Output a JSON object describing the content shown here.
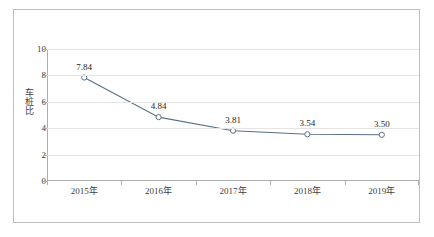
{
  "chart_data": {
    "type": "line",
    "title": "",
    "xlabel": "",
    "ylabel": "车桩比",
    "categories": [
      "2015年",
      "2016年",
      "2017年",
      "2018年",
      "2019年"
    ],
    "values": [
      7.84,
      4.84,
      3.81,
      3.54,
      3.5
    ],
    "data_labels": [
      "7.84",
      "4.84",
      "3.81",
      "3.54",
      "3.50"
    ],
    "ylim": [
      0,
      10
    ],
    "y_ticks": [
      "0",
      "2",
      "4",
      "6",
      "8",
      "10"
    ],
    "y_tick_values": [
      0,
      2,
      4,
      6,
      8,
      10
    ],
    "grid": true,
    "legend": "none",
    "series": [
      {
        "name": "车桩比",
        "values": [
          7.84,
          4.84,
          3.81,
          3.54,
          3.5
        ],
        "marker": "open-circle"
      }
    ]
  },
  "style": {
    "line_color": "#5b6f86",
    "marker_fill": "#ffffff",
    "marker_stroke": "#5b6f86",
    "gridline_color": "#e4e4e4",
    "axis_color": "#adadad",
    "frame_color": "#bfbfbf",
    "text_color": "#404040",
    "label_color": "#262626",
    "background": "#ffffff"
  }
}
